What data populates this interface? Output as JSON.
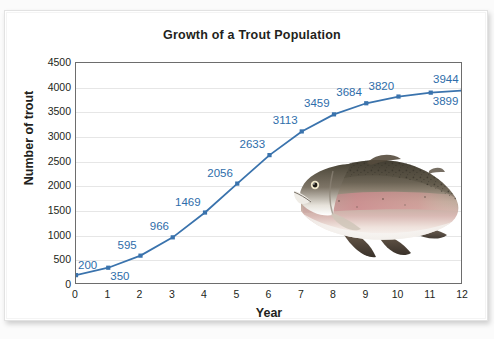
{
  "chart_data": {
    "type": "line",
    "title": "Growth of a Trout Population",
    "xlabel": "Year",
    "ylabel": "Number of trout",
    "x": [
      0,
      1,
      2,
      3,
      4,
      5,
      6,
      7,
      8,
      9,
      10,
      11,
      12
    ],
    "values": [
      200,
      350,
      595,
      966,
      1469,
      2056,
      2633,
      3113,
      3459,
      3684,
      3820,
      3899,
      3944
    ],
    "point_labels": [
      "200",
      "350",
      "595",
      "966",
      "1469",
      "2056",
      "2633",
      "3113",
      "3459",
      "3684",
      "3820",
      "3899",
      "3944"
    ],
    "label_positions": [
      "above-right",
      "below-right",
      "above-left",
      "above-left",
      "above-left",
      "above-left",
      "above-left",
      "above-left",
      "above-left",
      "above-left",
      "above-left",
      "below-right",
      "above-left"
    ],
    "xlim": [
      0,
      12
    ],
    "ylim": [
      0,
      4500
    ],
    "xticks": [
      "0",
      "1",
      "2",
      "3",
      "4",
      "5",
      "6",
      "7",
      "8",
      "9",
      "10",
      "11",
      "12"
    ],
    "yticks": [
      "0",
      "500",
      "1000",
      "1500",
      "2000",
      "2500",
      "3000",
      "3500",
      "4000",
      "4500"
    ],
    "grid": "horizontal",
    "legend": "none",
    "series_color": "#3a73ad",
    "label_color": "#2e6daa",
    "gridline_color": "#e6e6e6",
    "axis_color": "#6d6d6d",
    "annotation_image": "rainbow-trout-photo"
  }
}
